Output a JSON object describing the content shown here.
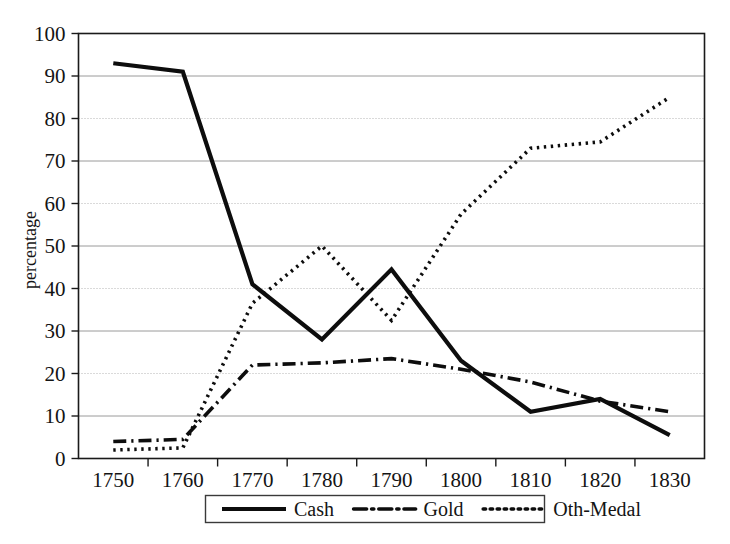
{
  "figure": {
    "background_color": "#ffffff",
    "ink_color": "#0d0d0d",
    "grid_color": "#9a9a9a"
  },
  "axes": {
    "y_title": "percentage",
    "y_ticks": [
      "0",
      "10",
      "20",
      "30",
      "40",
      "50",
      "60",
      "70",
      "80",
      "90",
      "100"
    ],
    "x_ticks": [
      "1750",
      "1760",
      "1770",
      "1780",
      "1790",
      "1800",
      "1810",
      "1820",
      "1830"
    ]
  },
  "legend": {
    "entries": [
      {
        "label": "Cash",
        "style": "solid"
      },
      {
        "label": "Gold",
        "style": "dash-dot"
      },
      {
        "label": "Oth-Medal",
        "style": "dotted"
      }
    ]
  },
  "chart_data": {
    "type": "line",
    "title": "",
    "subtitle": "",
    "xlabel": "",
    "ylabel": "percentage",
    "x": [
      1750,
      1760,
      1770,
      1780,
      1790,
      1800,
      1810,
      1820,
      1830
    ],
    "categories": [
      "1750",
      "1760",
      "1770",
      "1780",
      "1790",
      "1800",
      "1810",
      "1820",
      "1830"
    ],
    "xlim": [
      1750,
      1830
    ],
    "ylim": [
      0,
      100
    ],
    "y_tick_step": 10,
    "grid": true,
    "grid_axis": "y",
    "legend_position": "bottom",
    "series": [
      {
        "name": "Cash",
        "style": "solid",
        "color": "#0d0d0d",
        "values": [
          93,
          91,
          41,
          28,
          44.5,
          23,
          11,
          14,
          5.5
        ]
      },
      {
        "name": "Gold",
        "style": "dash-dot",
        "color": "#0d0d0d",
        "values": [
          4,
          4.5,
          22,
          22.5,
          23.5,
          21,
          18,
          13.5,
          11
        ]
      },
      {
        "name": "Oth-Medal",
        "style": "dotted",
        "color": "#0d0d0d",
        "values": [
          2,
          2.5,
          36.5,
          50,
          32.5,
          57.5,
          73,
          74.5,
          85
        ]
      }
    ]
  }
}
